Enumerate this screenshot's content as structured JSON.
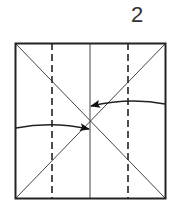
{
  "step": {
    "number": "2"
  },
  "diagram": {
    "square": {
      "x": 15,
      "y": 43,
      "width": 151,
      "height": 156,
      "stroke": "#222222"
    },
    "valley_folds": [
      {
        "x": 52,
        "style": "dashed"
      },
      {
        "x": 128,
        "style": "dashed"
      }
    ],
    "crease_center": {
      "x": 90,
      "style": "solid-thin"
    },
    "diagonals": 2,
    "arrows": [
      {
        "from": "right-edge",
        "to": "center",
        "direction": "left"
      },
      {
        "from": "left-edge",
        "to": "center",
        "direction": "right"
      }
    ],
    "colors": {
      "line": "#222222",
      "crease": "#444444",
      "background": "#ffffff"
    }
  }
}
